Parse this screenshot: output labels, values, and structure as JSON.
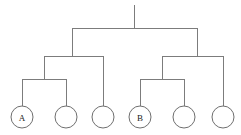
{
  "diagram": {
    "type": "tree",
    "canvas": {
      "width": 241,
      "height": 135
    },
    "style": {
      "line_color": "#7c7c7c",
      "circle_stroke_color": "#6f6f6f",
      "circle_fill_color": "#ffffff",
      "label_color": "#1a1a1a",
      "background_color": "#ffffff",
      "line_width": 1,
      "leaf_radius": 11
    },
    "root": {
      "name": "root-stem",
      "x": 134,
      "y_top": 5,
      "y_bottom": 28
    },
    "levels": [
      {
        "name": "level-1-connector",
        "y": 28,
        "x_start": 72,
        "x_end": 197,
        "parent_x": 134,
        "child_x": [
          72,
          197
        ]
      },
      {
        "name": "level-2-connector-left",
        "y": 56,
        "x_start": 44,
        "x_end": 103,
        "parent_x": 72,
        "child_x": [
          44,
          103
        ]
      },
      {
        "name": "level-2-connector-right",
        "y": 56,
        "x_start": 162,
        "x_end": 223,
        "parent_x": 197,
        "child_x": [
          162,
          223
        ]
      },
      {
        "name": "level-3-connector-left",
        "y": 79,
        "x_start": 22,
        "x_end": 66,
        "parent_x": 44,
        "child_x": [
          22,
          66
        ]
      },
      {
        "name": "level-3-connector-right",
        "y": 79,
        "x_start": 140,
        "x_end": 184,
        "parent_x": 162,
        "child_x": [
          140,
          184
        ]
      }
    ],
    "leaves": [
      {
        "name": "leaf-node-a",
        "label": "A",
        "cx": 22,
        "cy": 117,
        "stem_y_top": 79,
        "stem_y_bottom": 106
      },
      {
        "name": "leaf-node-2",
        "label": "",
        "cx": 66,
        "cy": 117,
        "stem_y_top": 79,
        "stem_y_bottom": 106
      },
      {
        "name": "leaf-node-3",
        "label": "",
        "cx": 103,
        "cy": 117,
        "stem_y_top": 56,
        "stem_y_bottom": 106
      },
      {
        "name": "leaf-node-b",
        "label": "B",
        "cx": 140,
        "cy": 117,
        "stem_y_top": 79,
        "stem_y_bottom": 106
      },
      {
        "name": "leaf-node-5",
        "label": "",
        "cx": 184,
        "cy": 117,
        "stem_y_top": 79,
        "stem_y_bottom": 106
      },
      {
        "name": "leaf-node-6",
        "label": "",
        "cx": 223,
        "cy": 117,
        "stem_y_top": 56,
        "stem_y_bottom": 106
      }
    ]
  }
}
